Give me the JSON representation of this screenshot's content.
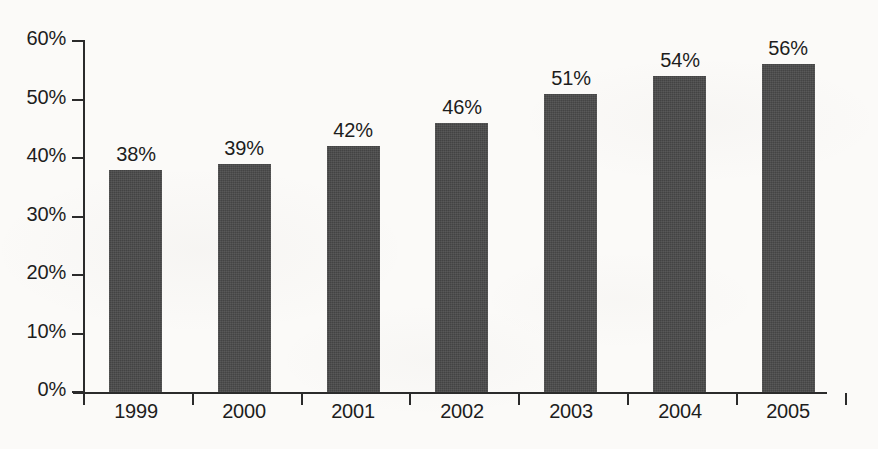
{
  "chart_data": {
    "type": "bar",
    "title": "",
    "subtitle": "",
    "xlabel": "",
    "ylabel": "",
    "categories": [
      "1999",
      "2000",
      "2001",
      "2002",
      "2003",
      "2004",
      "2005"
    ],
    "values": [
      38,
      39,
      42,
      46,
      51,
      54,
      56
    ],
    "data_labels": [
      "38%",
      "39%",
      "42%",
      "46%",
      "51%",
      "54%",
      "56%"
    ],
    "ylim": [
      0,
      60
    ],
    "ytick_step": 10,
    "ytick_labels": [
      "0%",
      "10%",
      "20%",
      "30%",
      "40%",
      "50%",
      "60%"
    ],
    "ytick_values": [
      0,
      10,
      20,
      30,
      40,
      50,
      60
    ],
    "grid": false,
    "legend": false,
    "legend_position": "none",
    "value_unit": "%",
    "series": [
      {
        "name": "",
        "values": [
          38,
          39,
          42,
          46,
          51,
          54,
          56
        ],
        "color": "#4a4a4a"
      }
    ],
    "annotations": []
  },
  "style": {
    "bar_color": "#4a4a4a",
    "axis_color": "#2b2b2b",
    "text_color": "#1d1d1d",
    "background_color": "#fbfaf8"
  }
}
